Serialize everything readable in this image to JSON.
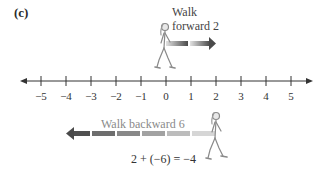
{
  "figure": {
    "panel_label": "(c)",
    "forward_step": {
      "label_line1": "Walk",
      "label_line2": "forward 2",
      "from": 0,
      "to": 2
    },
    "backward_step": {
      "label": "Walk backward 6",
      "from": 2,
      "to": -4
    },
    "equation": "2 + (−6) = −4"
  },
  "number_line": {
    "min": -5,
    "max": 5,
    "ticks": [
      {
        "value": -5,
        "label": "−5",
        "x": 41
      },
      {
        "value": -4,
        "label": "−4",
        "x": 66
      },
      {
        "value": -3,
        "label": "−3",
        "x": 91
      },
      {
        "value": -2,
        "label": "−2",
        "x": 116
      },
      {
        "value": -1,
        "label": "−1",
        "x": 141
      },
      {
        "value": 0,
        "label": "0",
        "x": 166
      },
      {
        "value": 1,
        "label": "1",
        "x": 191
      },
      {
        "value": 2,
        "label": "2",
        "x": 216
      },
      {
        "value": 3,
        "label": "3",
        "x": 241
      },
      {
        "value": 4,
        "label": "4",
        "x": 266
      },
      {
        "value": 5,
        "label": "5",
        "x": 291
      }
    ]
  },
  "colors": {
    "arrow_dark": "#555555",
    "arrow_light": "#d8d8d8",
    "line": "#333333"
  }
}
